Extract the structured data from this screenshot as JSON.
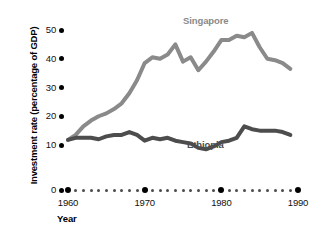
{
  "chart_data": {
    "type": "line",
    "title": "",
    "xlabel": "Year",
    "ylabel": "Investment rate (percentage of GDP)",
    "xlim": [
      1960,
      1990
    ],
    "ylim": [
      0,
      50
    ],
    "yticks": [
      0,
      10,
      20,
      30,
      40,
      50
    ],
    "ytick_labels": [
      "0",
      "10",
      "20",
      "30",
      "40",
      "50"
    ],
    "xticks_major": [
      1960,
      1970,
      1980,
      1990
    ],
    "xtick_labels": [
      "1960",
      "1970",
      "1980",
      "1990"
    ],
    "grid": false,
    "legend_position": "inline-annotation",
    "x": [
      1960,
      1961,
      1962,
      1963,
      1964,
      1965,
      1966,
      1967,
      1968,
      1969,
      1970,
      1971,
      1972,
      1973,
      1974,
      1975,
      1976,
      1977,
      1978,
      1979,
      1980,
      1981,
      1982,
      1983,
      1984,
      1985,
      1986,
      1987,
      1988,
      1989
    ],
    "series": [
      {
        "name": "Singapore",
        "color": "#8a8a8a",
        "values": [
          11.8,
          13.5,
          16.5,
          18.5,
          20.0,
          21.0,
          22.5,
          24.5,
          28.0,
          32.5,
          38.5,
          40.5,
          40.0,
          41.5,
          45.0,
          39.0,
          40.5,
          36.0,
          39.0,
          42.5,
          46.5,
          46.5,
          48.0,
          47.5,
          49.0,
          44.0,
          40.0,
          39.5,
          38.5,
          36.5
        ]
      },
      {
        "name": "Ethiopia",
        "color": "#4d4d4d",
        "values": [
          11.8,
          12.5,
          12.5,
          12.5,
          12.0,
          13.0,
          13.5,
          13.5,
          14.5,
          13.5,
          11.5,
          12.5,
          12.0,
          12.5,
          11.5,
          11.0,
          10.5,
          9.0,
          8.5,
          9.5,
          11.0,
          11.5,
          12.5,
          16.5,
          15.5,
          15.0,
          15.0,
          15.0,
          14.5,
          13.5
        ]
      }
    ],
    "annotations": [
      {
        "text": "Singapore",
        "series": "Singapore"
      },
      {
        "text": "Ethiopia",
        "series": "Ethiopia"
      }
    ]
  },
  "axes": {
    "y_title": "Investment rate (percentage of GDP)",
    "x_title": "Year"
  },
  "colors": {
    "singapore": "#8a8a8a",
    "ethiopia": "#4d4d4d",
    "axis": "#000000",
    "background": "#ffffff"
  }
}
